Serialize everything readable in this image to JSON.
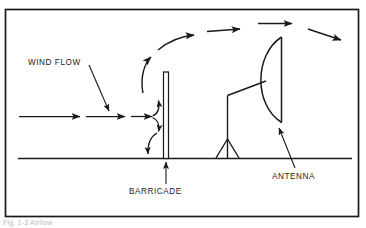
{
  "figure": {
    "frame": {
      "color": "#1a1a1a"
    },
    "caption": "Fig. 1-3  Airflow",
    "ink_color": "#1a1a1a",
    "background": "#ffffff"
  },
  "labels": {
    "wind_flow": "WIND FLOW",
    "barricade": "BARRICADE",
    "antenna": "ANTENNA"
  },
  "diagram_elements": {
    "ground_line": "ground-line",
    "barricade_shape": "vertical-hollow-panel",
    "antenna_shape": "parabolic-dish-on-tripod",
    "incoming_arrows": 3,
    "deflection_arrows": 3,
    "overhead_arrows": 4
  }
}
